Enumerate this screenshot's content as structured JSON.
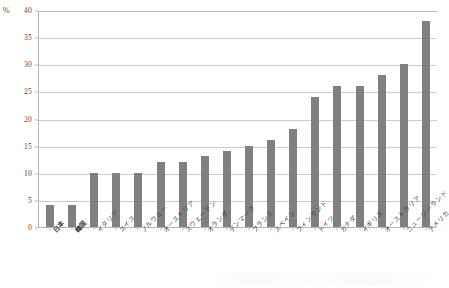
{
  "chart_data": {
    "type": "bar",
    "title": "",
    "xlabel": "",
    "ylabel": "%",
    "unit_label": "%",
    "ylim": [
      0,
      40
    ],
    "ytick_step": 5,
    "yticks": [
      "0",
      "5",
      "10",
      "15",
      "20",
      "25",
      "30",
      "35",
      "40"
    ],
    "grid": true,
    "legend": "none",
    "bar_color": "#808080",
    "grid_color": "#cccccc",
    "axis_color": "#b5b5b5",
    "categories": [
      "日本",
      "韓国",
      "イタリア",
      "スイス",
      "ノルウェー",
      "オーストリア",
      "スウェーデン",
      "オランダ",
      "デンマーク",
      "フランス",
      "スペイン",
      "フィンランド",
      "ドイツ",
      "カナダ",
      "イギリス",
      "オーストラリア",
      "ニュージーランド",
      "アメリカ"
    ],
    "emphasized_categories": [
      "日本",
      "韓国"
    ],
    "values": [
      4,
      4,
      10,
      10,
      10,
      12,
      12,
      13,
      14,
      15,
      16,
      18,
      24,
      26,
      26,
      28,
      30,
      38
    ]
  }
}
